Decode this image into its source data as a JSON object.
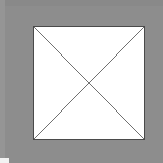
{
  "graphic": {
    "kind": "broken-image-placeholder",
    "description": "Gray field containing a white rectangle with a thin dark outline crossed by two diagonal lines forming an X",
    "canvas": {
      "width": 163,
      "height": 163,
      "background_color": "#8d8d8d",
      "top_band_color": "#898989",
      "left_band_color": "#959595"
    },
    "corner_notch": {
      "label": "bottom-left notch",
      "color": "#f2f2f2",
      "width": 9,
      "height": 5
    },
    "image_box": {
      "label": "missing image box",
      "x": 33,
      "y": 26,
      "width": 112,
      "height": 114,
      "fill_color": "#ffffff",
      "border_color": "#4a4a4a",
      "border_width": 1
    },
    "cross": {
      "label": "diagonal cross",
      "stroke_color": "#6d6d6d",
      "stroke_width": 1,
      "center_x": 89,
      "center_y": 83,
      "diagonals": [
        {
          "name": "top-left-to-bottom-right",
          "x1": 0,
          "y1": 0,
          "x2": 112,
          "y2": 114
        },
        {
          "name": "bottom-left-to-top-right",
          "x1": 0,
          "y1": 114,
          "x2": 112,
          "y2": 0
        }
      ]
    }
  }
}
